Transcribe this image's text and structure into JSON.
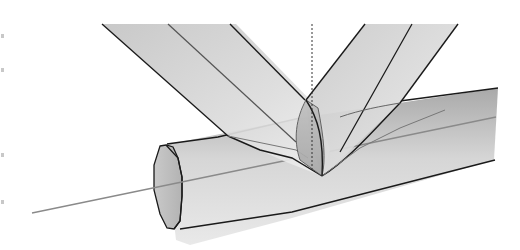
{
  "diagram": {
    "type": "3d-pipe-intersection",
    "colors": {
      "background": "#ffffff",
      "outline": "#1a1a1a",
      "inner_edge": "#555555",
      "axis_line": "#8a8a8a",
      "shade_light": "#f2f2f2",
      "shade_mid": "#cfcfcf",
      "shade_dark": "#a8a8a8",
      "end_face": "#bdbdbd"
    },
    "elements": {
      "left_branch": {
        "label": "left-inclined-branch"
      },
      "right_branch": {
        "label": "right-inclined-branch"
      },
      "main_pipe": {
        "label": "horizontal-main-pipe"
      },
      "pipe_end_face": {
        "label": "octagonal-end-face"
      },
      "center_axis": {
        "label": "pipe-center-axis"
      },
      "vertical_reference": {
        "label": "vertical-dotted-reference-line"
      },
      "intersection_curve": {
        "label": "saddle-intersection-curve"
      }
    },
    "edge_marks": [
      34,
      68,
      153,
      200
    ]
  }
}
